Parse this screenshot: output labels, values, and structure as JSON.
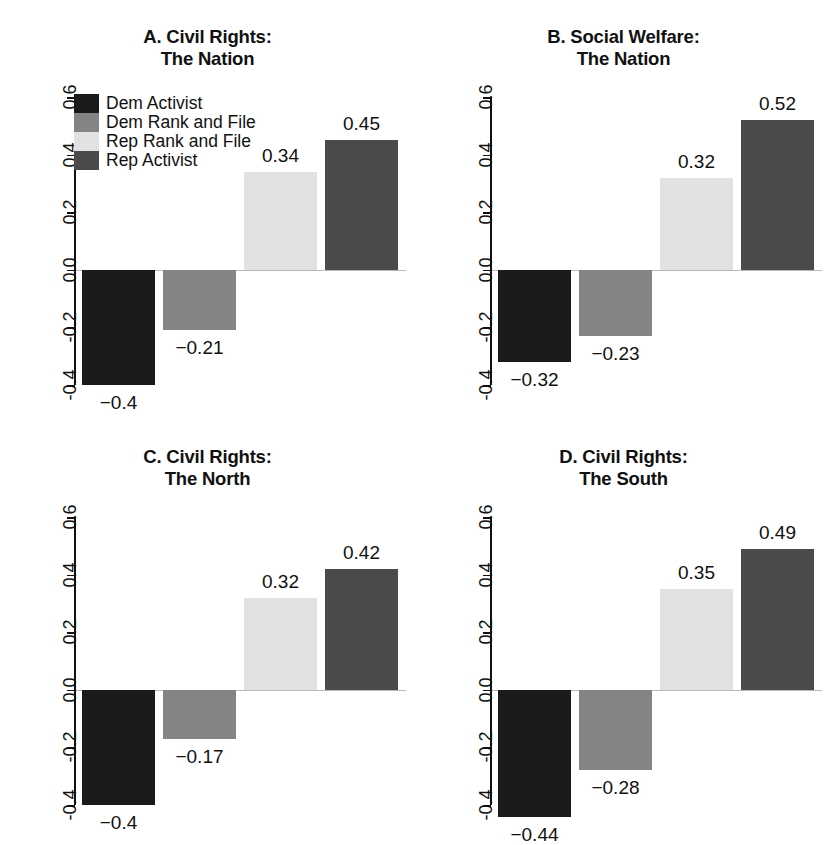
{
  "figure": {
    "width": 831,
    "height": 839,
    "background": "#ffffff"
  },
  "legend": {
    "position": "top-left-panel-A",
    "entries": [
      {
        "label": "Dem Activist",
        "color": "#1a1a1a"
      },
      {
        "label": "Dem Rank and File",
        "color": "#848484"
      },
      {
        "label": "Rep Rank and File",
        "color": "#e2e2e2"
      },
      {
        "label": "Rep Activist",
        "color": "#4a4a4a"
      }
    ]
  },
  "axis": {
    "ticks": [
      "0.6",
      "0.4",
      "0.2",
      "0.0",
      "-0.2",
      "-0.4"
    ],
    "tick_values": [
      0.6,
      0.4,
      0.2,
      0.0,
      -0.2,
      -0.4
    ],
    "ylim": [
      -0.4,
      0.6
    ],
    "grid": false
  },
  "chart_data": [
    {
      "type": "bar",
      "panel": "A",
      "title": "A. Civil Rights:\nThe Nation",
      "title_line1": "A. Civil Rights:",
      "title_line2": "The Nation",
      "categories": [
        "Dem Activist",
        "Dem Rank and File",
        "Rep Rank and File",
        "Rep Activist"
      ],
      "values": [
        -0.4,
        -0.21,
        0.34,
        0.45
      ],
      "labels": [
        "−0.4",
        "−0.21",
        "0.34",
        "0.45"
      ],
      "colors": [
        "#1a1a1a",
        "#848484",
        "#e2e2e2",
        "#4a4a4a"
      ],
      "xlabel": "",
      "ylabel": "",
      "ylim": [
        -0.4,
        0.6
      ],
      "yticks": [
        0.6,
        0.4,
        0.2,
        0.0,
        -0.2,
        -0.4
      ]
    },
    {
      "type": "bar",
      "panel": "B",
      "title": "B. Social Welfare:\nThe Nation",
      "title_line1": "B. Social Welfare:",
      "title_line2": "The Nation",
      "categories": [
        "Dem Activist",
        "Dem Rank and File",
        "Rep Rank and File",
        "Rep Activist"
      ],
      "values": [
        -0.32,
        -0.23,
        0.32,
        0.52
      ],
      "labels": [
        "−0.32",
        "−0.23",
        "0.32",
        "0.52"
      ],
      "colors": [
        "#1a1a1a",
        "#848484",
        "#e2e2e2",
        "#4a4a4a"
      ],
      "xlabel": "",
      "ylabel": "",
      "ylim": [
        -0.4,
        0.6
      ],
      "yticks": [
        0.6,
        0.4,
        0.2,
        0.0,
        -0.2,
        -0.4
      ]
    },
    {
      "type": "bar",
      "panel": "C",
      "title": "C. Civil Rights:\nThe North",
      "title_line1": "C. Civil Rights:",
      "title_line2": "The North",
      "categories": [
        "Dem Activist",
        "Dem Rank and File",
        "Rep Rank and File",
        "Rep Activist"
      ],
      "values": [
        -0.4,
        -0.17,
        0.32,
        0.42
      ],
      "labels": [
        "−0.4",
        "−0.17",
        "0.32",
        "0.42"
      ],
      "colors": [
        "#1a1a1a",
        "#848484",
        "#e2e2e2",
        "#4a4a4a"
      ],
      "xlabel": "",
      "ylabel": "",
      "ylim": [
        -0.4,
        0.6
      ],
      "yticks": [
        0.6,
        0.4,
        0.2,
        0.0,
        -0.2,
        -0.4
      ]
    },
    {
      "type": "bar",
      "panel": "D",
      "title": "D. Civil Rights:\nThe South",
      "title_line1": "D. Civil Rights:",
      "title_line2": "The South",
      "categories": [
        "Dem Activist",
        "Dem Rank and File",
        "Rep Rank and File",
        "Rep Activist"
      ],
      "values": [
        -0.44,
        -0.28,
        0.35,
        0.49
      ],
      "labels": [
        "−0.44",
        "−0.28",
        "0.35",
        "0.49"
      ],
      "colors": [
        "#1a1a1a",
        "#848484",
        "#e2e2e2",
        "#4a4a4a"
      ],
      "xlabel": "",
      "ylabel": "",
      "ylim": [
        -0.4,
        0.6
      ],
      "yticks": [
        0.6,
        0.4,
        0.2,
        0.0,
        -0.2,
        -0.4
      ]
    }
  ]
}
